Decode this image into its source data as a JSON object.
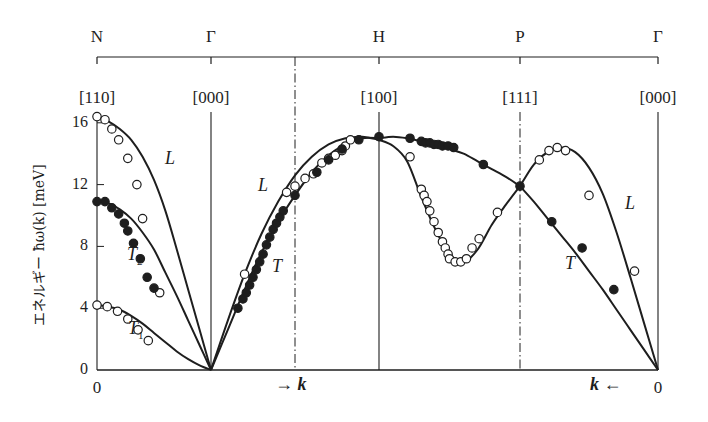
{
  "chart_data": {
    "type": "line",
    "title": "",
    "ylabel": "エネルギー ħω(k) [meV]",
    "xlabel": "k",
    "ylim": [
      0,
      16.5
    ],
    "yticks": [
      0,
      4,
      8,
      12,
      16
    ],
    "grid": false,
    "symmetry_points": [
      {
        "name": "N",
        "index": "[110]",
        "x": 97
      },
      {
        "name": "Γ",
        "index": "[000]",
        "x": 211
      },
      {
        "name": "H",
        "index": "[100]",
        "x": 379
      },
      {
        "name": "P",
        "index": "[111]",
        "x": 520
      },
      {
        "name": "Γ",
        "index": "[000]",
        "x": 658
      }
    ],
    "dashdot_lines_x": [
      295,
      520
    ],
    "bottom_labels": [
      {
        "text": "0",
        "x": 97
      },
      {
        "text": "→ k",
        "x": 275
      },
      {
        "text": "k ←",
        "x": 590
      },
      {
        "text": "0",
        "x": 658
      }
    ],
    "series": [
      {
        "name": "L (N–Γ)",
        "marker": "open",
        "curve": [
          [
            0,
            16.4
          ],
          [
            0.1,
            16.1
          ],
          [
            0.2,
            15.6
          ],
          [
            0.3,
            14.9
          ],
          [
            0.4,
            13.8
          ],
          [
            0.5,
            12.3
          ],
          [
            0.6,
            10.3
          ],
          [
            0.7,
            7.8
          ],
          [
            0.8,
            5.2
          ],
          [
            0.9,
            2.6
          ],
          [
            1.0,
            0
          ]
        ],
        "points": [
          [
            0,
            16.4
          ],
          [
            0.07,
            16.2
          ],
          [
            0.13,
            15.6
          ],
          [
            0.19,
            14.9
          ],
          [
            0.27,
            13.7
          ],
          [
            0.35,
            12.0
          ],
          [
            0.4,
            9.8
          ],
          [
            0.55,
            5.0
          ]
        ]
      },
      {
        "name": "T2 (N–Γ)",
        "marker": "filled",
        "curve": [
          [
            0,
            10.9
          ],
          [
            0.1,
            10.8
          ],
          [
            0.2,
            10.4
          ],
          [
            0.3,
            9.8
          ],
          [
            0.4,
            8.9
          ],
          [
            0.5,
            7.8
          ],
          [
            0.6,
            6.3
          ],
          [
            0.7,
            4.8
          ],
          [
            0.8,
            3.2
          ],
          [
            0.9,
            1.6
          ],
          [
            1.0,
            0
          ]
        ],
        "points": [
          [
            0,
            10.9
          ],
          [
            0.07,
            10.9
          ],
          [
            0.13,
            10.5
          ],
          [
            0.19,
            10.1
          ],
          [
            0.24,
            9.5
          ],
          [
            0.27,
            9.0
          ],
          [
            0.32,
            8.2
          ],
          [
            0.38,
            7.2
          ],
          [
            0.44,
            6.0
          ],
          [
            0.5,
            5.3
          ]
        ]
      },
      {
        "name": "T1 (N–Γ)",
        "marker": "open",
        "curve": [
          [
            0,
            4.2
          ],
          [
            0.1,
            4.1
          ],
          [
            0.2,
            3.9
          ],
          [
            0.3,
            3.5
          ],
          [
            0.4,
            3.0
          ],
          [
            0.5,
            2.4
          ],
          [
            0.6,
            1.8
          ],
          [
            0.7,
            1.2
          ],
          [
            0.8,
            0.7
          ],
          [
            0.9,
            0.3
          ],
          [
            1.0,
            0
          ]
        ],
        "points": [
          [
            0,
            4.2
          ],
          [
            0.09,
            4.1
          ],
          [
            0.18,
            3.8
          ],
          [
            0.27,
            3.3
          ],
          [
            0.36,
            2.6
          ],
          [
            0.45,
            1.9
          ]
        ]
      },
      {
        "name": "L (Γ–H)",
        "marker": "open",
        "curve": [
          [
            0,
            0
          ],
          [
            0.1,
            3.2
          ],
          [
            0.2,
            6.2
          ],
          [
            0.3,
            8.8
          ],
          [
            0.4,
            10.9
          ],
          [
            0.5,
            12.6
          ],
          [
            0.6,
            13.8
          ],
          [
            0.7,
            14.6
          ],
          [
            0.8,
            15.0
          ],
          [
            0.9,
            15.1
          ],
          [
            1.0,
            14.9
          ]
        ],
        "points": [
          [
            0.2,
            6.2
          ],
          [
            0.45,
            11.5
          ],
          [
            0.5,
            11.9
          ],
          [
            0.56,
            12.4
          ],
          [
            0.61,
            12.7
          ],
          [
            0.66,
            13.4
          ],
          [
            0.7,
            13.7
          ],
          [
            0.74,
            13.9
          ],
          [
            0.78,
            14.2
          ],
          [
            0.8,
            14.5
          ],
          [
            0.83,
            14.9
          ]
        ]
      },
      {
        "name": "T (Γ–H)",
        "marker": "filled",
        "curve": [
          [
            0,
            0
          ],
          [
            0.1,
            2.6
          ],
          [
            0.2,
            5.2
          ],
          [
            0.3,
            7.6
          ],
          [
            0.4,
            9.6
          ],
          [
            0.5,
            11.3
          ],
          [
            0.6,
            12.8
          ],
          [
            0.7,
            13.9
          ],
          [
            0.8,
            14.6
          ],
          [
            0.9,
            15.0
          ],
          [
            1.0,
            15.0
          ]
        ],
        "points": [
          [
            0.16,
            4.0
          ],
          [
            0.19,
            4.6
          ],
          [
            0.21,
            5.0
          ],
          [
            0.23,
            5.5
          ],
          [
            0.25,
            6.0
          ],
          [
            0.27,
            6.5
          ],
          [
            0.29,
            7.0
          ],
          [
            0.31,
            7.5
          ],
          [
            0.33,
            8.1
          ],
          [
            0.35,
            8.6
          ],
          [
            0.37,
            9.1
          ],
          [
            0.39,
            9.5
          ],
          [
            0.41,
            9.9
          ],
          [
            0.43,
            10.3
          ],
          [
            0.5,
            11.3
          ],
          [
            0.63,
            12.8
          ],
          [
            0.7,
            13.6
          ],
          [
            0.78,
            14.3
          ],
          [
            0.88,
            14.9
          ],
          [
            1.0,
            15.1
          ]
        ]
      },
      {
        "name": "L (H–P)",
        "marker": "open",
        "curve": [
          [
            0,
            14.9
          ],
          [
            0.1,
            14.5
          ],
          [
            0.2,
            13.5
          ],
          [
            0.3,
            11.2
          ],
          [
            0.4,
            9.1
          ],
          [
            0.5,
            7.5
          ],
          [
            0.6,
            7.0
          ],
          [
            0.7,
            7.8
          ],
          [
            0.8,
            9.4
          ],
          [
            0.9,
            10.7
          ],
          [
            1.0,
            11.9
          ]
        ],
        "points": [
          [
            0.22,
            13.8
          ],
          [
            0.3,
            11.7
          ],
          [
            0.32,
            11.3
          ],
          [
            0.34,
            10.9
          ],
          [
            0.36,
            10.3
          ],
          [
            0.39,
            9.6
          ],
          [
            0.42,
            8.9
          ],
          [
            0.45,
            8.3
          ],
          [
            0.47,
            7.9
          ],
          [
            0.49,
            7.5
          ],
          [
            0.5,
            7.2
          ],
          [
            0.54,
            7.0
          ],
          [
            0.58,
            7.0
          ],
          [
            0.62,
            7.2
          ],
          [
            0.66,
            7.9
          ],
          [
            0.71,
            8.5
          ],
          [
            0.84,
            10.2
          ]
        ]
      },
      {
        "name": "T (H–P)",
        "marker": "filled",
        "curve": [
          [
            0,
            15.0
          ],
          [
            0.1,
            15.1
          ],
          [
            0.2,
            15.0
          ],
          [
            0.3,
            14.8
          ],
          [
            0.4,
            14.6
          ],
          [
            0.5,
            14.3
          ],
          [
            0.6,
            14.0
          ],
          [
            0.7,
            13.5
          ],
          [
            0.8,
            13.0
          ],
          [
            0.9,
            12.5
          ],
          [
            1.0,
            11.9
          ]
        ],
        "points": [
          [
            0.22,
            15.0
          ],
          [
            0.3,
            14.8
          ],
          [
            0.33,
            14.7
          ],
          [
            0.36,
            14.7
          ],
          [
            0.39,
            14.6
          ],
          [
            0.42,
            14.6
          ],
          [
            0.45,
            14.5
          ],
          [
            0.49,
            14.5
          ],
          [
            0.53,
            14.4
          ],
          [
            0.74,
            13.3
          ],
          [
            1.0,
            11.9
          ]
        ]
      },
      {
        "name": "L (P–Γ)",
        "marker": "open",
        "curve": [
          [
            0,
            11.9
          ],
          [
            0.1,
            13.3
          ],
          [
            0.2,
            14.1
          ],
          [
            0.3,
            14.4
          ],
          [
            0.4,
            14.1
          ],
          [
            0.5,
            13.1
          ],
          [
            0.6,
            11.4
          ],
          [
            0.7,
            8.9
          ],
          [
            0.8,
            6.0
          ],
          [
            0.9,
            3.0
          ],
          [
            1.0,
            0
          ]
        ],
        "points": [
          [
            0.14,
            13.6
          ],
          [
            0.21,
            14.2
          ],
          [
            0.27,
            14.4
          ],
          [
            0.33,
            14.2
          ],
          [
            0.5,
            11.3
          ],
          [
            0.83,
            6.4
          ]
        ]
      },
      {
        "name": "T (P–Γ)",
        "marker": "filled",
        "curve": [
          [
            0,
            11.9
          ],
          [
            0.1,
            10.9
          ],
          [
            0.2,
            9.8
          ],
          [
            0.3,
            8.7
          ],
          [
            0.4,
            7.6
          ],
          [
            0.5,
            6.4
          ],
          [
            0.6,
            5.2
          ],
          [
            0.7,
            3.9
          ],
          [
            0.8,
            2.6
          ],
          [
            0.9,
            1.3
          ],
          [
            1.0,
            0
          ]
        ],
        "points": [
          [
            0.23,
            9.6
          ],
          [
            0.45,
            7.9
          ],
          [
            0.68,
            5.2
          ]
        ]
      }
    ],
    "branch_labels": [
      {
        "text": "L",
        "sub": "",
        "x": 165,
        "y": 160
      },
      {
        "text": "T",
        "sub": "2",
        "x": 127,
        "y": 256
      },
      {
        "text": "T",
        "sub": "1",
        "x": 128,
        "y": 330
      },
      {
        "text": "L",
        "sub": "",
        "x": 258,
        "y": 187
      },
      {
        "text": "T",
        "sub": "",
        "x": 272,
        "y": 268
      },
      {
        "text": "L",
        "sub": "",
        "x": 625,
        "y": 205
      },
      {
        "text": "T",
        "sub": "",
        "x": 565,
        "y": 265
      }
    ]
  },
  "axis": {
    "ytick_labels": [
      "0",
      "4",
      "8",
      "12",
      "16"
    ],
    "ylabel": "エネルギー ħω(k) [meV]"
  },
  "colors": {
    "ink": "#1e1e1e",
    "background": "#ffffff"
  }
}
